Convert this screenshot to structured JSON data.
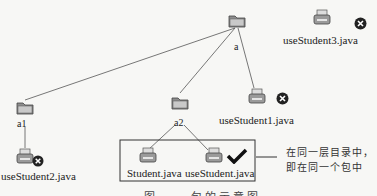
{
  "diagram": {
    "nodes": {
      "root_folder": {
        "label": "a",
        "type": "folder"
      },
      "a1_folder": {
        "label": "a1",
        "type": "folder"
      },
      "a2_folder": {
        "label": "a2",
        "type": "folder"
      },
      "useStudent3": {
        "label": "useStudent3.java",
        "type": "file",
        "status": "invalid"
      },
      "useStudent1": {
        "label": "useStudent1.java",
        "type": "file",
        "status": "invalid"
      },
      "useStudent2": {
        "label": "useStudent2.java",
        "type": "file",
        "status": "invalid"
      },
      "student": {
        "label": "Student.java",
        "type": "file"
      },
      "useStudent": {
        "label": "useStudent.java",
        "type": "file",
        "status": "valid"
      }
    },
    "edges": [
      [
        "a",
        "a1"
      ],
      [
        "a",
        "a2"
      ],
      [
        "a",
        "useStudent1.java"
      ],
      [
        "a1",
        "useStudent2.java"
      ],
      [
        "a2",
        "Student.java"
      ],
      [
        "a2",
        "useStudent.java"
      ]
    ],
    "annotation": {
      "line1": "在同一层目录中，",
      "line2": "即在同一个包中"
    },
    "caption": "图 ·-· 包的示意图",
    "colors": {
      "line": "#555555",
      "folder": "#9a9a9a",
      "x_badge": "#222222",
      "check": "#111111"
    }
  }
}
